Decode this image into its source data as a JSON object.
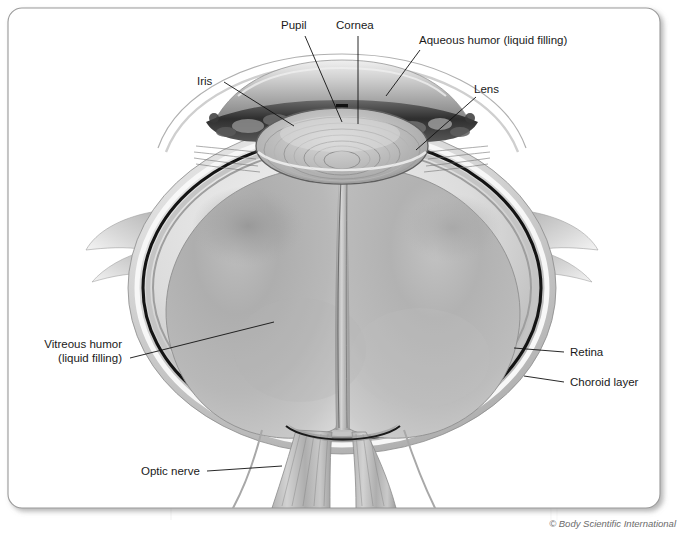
{
  "figure": {
    "credit": "© Body Scientific International"
  },
  "labels": {
    "pupil": "Pupil",
    "cornea": "Cornea",
    "aqueous": "Aqueous humor (liquid filling)",
    "iris": "Iris",
    "lens": "Lens",
    "vitreous_line1": "Vitreous humor",
    "vitreous_line2": "(liquid filling)",
    "retina": "Retina",
    "choroid": "Choroid layer",
    "optic_nerve": "Optic nerve"
  },
  "colors": {
    "frame_border": "#9a9a9a",
    "page_background": "#ffffff",
    "label_text": "#1a1a1a",
    "credit_text": "#6b6b6b",
    "leader_line": "#111111",
    "sclera_light": "#e8e8e8",
    "sclera_mid": "#b5b5b5",
    "choroid_dark": "#141414",
    "vitreous_light": "#cfcfcf",
    "vitreous_mid": "#a8a8a8",
    "vitreous_shadow": "#8d8d8d",
    "lens_light": "#d8d8d8",
    "iris_dark": "#2c2c2c",
    "cornea_tint": "#d9d9d9"
  }
}
